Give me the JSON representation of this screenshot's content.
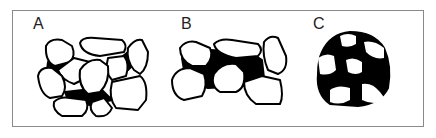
{
  "figure": {
    "panels": [
      {
        "label": "A",
        "description": "grain-supported packing, grains touching with small dark interstitial fill"
      },
      {
        "label": "B",
        "description": "grains partially touching, larger dark matrix areas between grains"
      },
      {
        "label": "C",
        "description": "matrix-supported, white grains floating in dark circular matrix"
      }
    ],
    "colors": {
      "grain": "#ffffff",
      "matrix": "#000000",
      "frame": "#8a8a8a"
    }
  }
}
